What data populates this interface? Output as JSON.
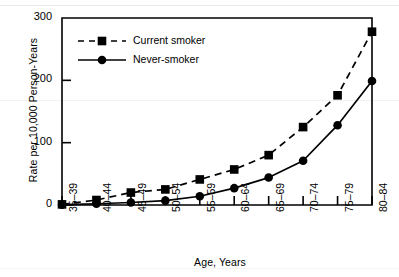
{
  "chart_data": {
    "type": "line",
    "title": "",
    "subtitle": "",
    "xlabel": "Age, Years",
    "ylabel": "Rate per 10,000 Person-Years",
    "categories": [
      "35–39",
      "40–44",
      "45–49",
      "50–54",
      "55–59",
      "60–64",
      "65–69",
      "70–74",
      "75–79",
      "80–84"
    ],
    "series": [
      {
        "name": "Current smoker",
        "marker": "square",
        "linestyle": "dashed",
        "color": "#000000",
        "values": [
          1,
          8,
          20,
          25,
          41,
          57,
          80,
          125,
          176,
          278
        ]
      },
      {
        "name": "Never-smoker",
        "marker": "circle",
        "linestyle": "solid",
        "color": "#000000",
        "values": [
          0.5,
          2,
          4,
          7,
          14,
          27,
          44,
          71,
          128,
          199
        ]
      }
    ],
    "ylim": [
      0,
      300
    ],
    "yticks": [
      0,
      100,
      200,
      300
    ],
    "ytick_labels": [
      "0",
      "100",
      "200",
      "300"
    ],
    "grid": false,
    "legend_position": "upper-left-inside",
    "axis_color": "#000000",
    "background": "#ffffff"
  }
}
